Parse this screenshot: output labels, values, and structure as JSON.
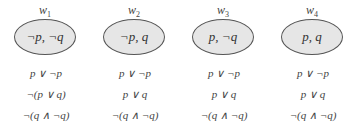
{
  "diagram": {
    "worlds": [
      {
        "label": "w",
        "index": "1",
        "valuation": "¬p, ¬q",
        "formulas": [
          "p ∨ ¬p",
          "¬(p ∨ q)",
          "¬(q ∧ ¬q)"
        ]
      },
      {
        "label": "w",
        "index": "2",
        "valuation": "¬p, q",
        "formulas": [
          "p ∨ ¬p",
          "p ∨ q",
          "¬(q ∧ ¬q)"
        ]
      },
      {
        "label": "w",
        "index": "3",
        "valuation": "p, ¬q",
        "formulas": [
          "p ∨ ¬p",
          "p ∨ q",
          "¬(q ∧ ¬q)"
        ]
      },
      {
        "label": "w",
        "index": "4",
        "valuation": "p, q",
        "formulas": [
          "p ∨ ¬p",
          "p ∨ q",
          "¬(q ∧ ¬q)"
        ]
      }
    ],
    "colors": {
      "ellipse_fill": "#e6e6e6",
      "ellipse_stroke": "#555555",
      "text": "#444444"
    }
  }
}
